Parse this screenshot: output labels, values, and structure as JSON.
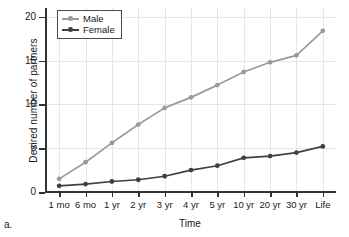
{
  "panel": {
    "label": "a."
  },
  "chart_data": {
    "type": "line",
    "title": "",
    "xlabel": "Time",
    "ylabel": "Desired number of partners",
    "categories": [
      "1 mo",
      "6 mo",
      "1 yr",
      "2 yr",
      "3 yr",
      "4 yr",
      "5 yr",
      "10 yr",
      "20 yr",
      "30 yr",
      "Life"
    ],
    "series": [
      {
        "name": "Male",
        "color": "#9a9a9a",
        "marker": "circle",
        "values": [
          1.5,
          3.4,
          5.6,
          7.7,
          9.6,
          10.8,
          12.2,
          13.7,
          14.8,
          15.6,
          18.4
        ]
      },
      {
        "name": "Female",
        "color": "#404040",
        "marker": "circle",
        "values": [
          0.7,
          0.9,
          1.2,
          1.4,
          1.8,
          2.5,
          3.0,
          3.9,
          4.1,
          4.5,
          5.2
        ]
      }
    ],
    "ylim": [
      0,
      21
    ],
    "yticks": [
      0,
      5,
      10,
      15,
      20
    ],
    "ytick_labels": [
      "0",
      "5",
      "10",
      "15",
      "20"
    ],
    "grid": true,
    "legend_position": "top-left"
  }
}
